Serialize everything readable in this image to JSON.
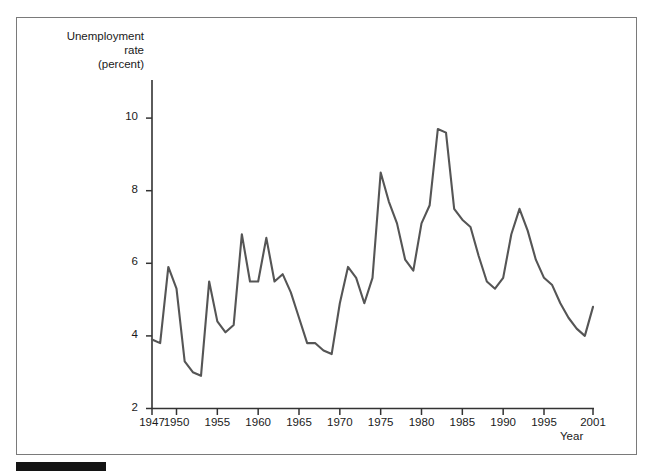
{
  "figure": {
    "y_axis_title": "Unemployment\nrate\n(percent)",
    "x_axis_title": "Year",
    "line_color": "#555555",
    "axis_color": "#333333",
    "frame_color": "#7a7a7a",
    "footer_bar_color": "#141414"
  },
  "chart_data": {
    "type": "line",
    "title": "",
    "subtitle": "",
    "xlabel": "Year",
    "ylabel": "Unemployment rate (percent)",
    "xlim": [
      1947,
      2001
    ],
    "ylim": [
      2,
      10.6
    ],
    "grid": false,
    "legend": "none",
    "y_ticks": [
      2,
      4,
      6,
      8,
      10
    ],
    "y_tick_labels": [
      "2",
      "4",
      "6",
      "8",
      "10"
    ],
    "x_ticks": [
      1947,
      1950,
      1955,
      1960,
      1965,
      1970,
      1975,
      1980,
      1985,
      1990,
      1995,
      2001
    ],
    "x_tick_labels": [
      "1947",
      "1950",
      "1955",
      "1960",
      "1965",
      "1970",
      "1975",
      "1980",
      "1985",
      "1990",
      "1995",
      "2001"
    ],
    "series": [
      {
        "name": "Unemployment rate",
        "x": [
          1947,
          1948,
          1949,
          1950,
          1951,
          1952,
          1953,
          1954,
          1955,
          1956,
          1957,
          1958,
          1959,
          1960,
          1961,
          1962,
          1963,
          1964,
          1965,
          1966,
          1967,
          1968,
          1969,
          1970,
          1971,
          1972,
          1973,
          1974,
          1975,
          1976,
          1977,
          1978,
          1979,
          1980,
          1981,
          1982,
          1983,
          1984,
          1985,
          1986,
          1987,
          1988,
          1989,
          1990,
          1991,
          1992,
          1993,
          1994,
          1995,
          1996,
          1997,
          1998,
          1999,
          2000,
          2001
        ],
        "values": [
          3.9,
          3.8,
          5.9,
          5.3,
          3.3,
          3.0,
          2.9,
          5.5,
          4.4,
          4.1,
          4.3,
          6.8,
          5.5,
          5.5,
          6.7,
          5.5,
          5.7,
          5.2,
          4.5,
          3.8,
          3.8,
          3.6,
          3.5,
          4.9,
          5.9,
          5.6,
          4.9,
          5.6,
          8.5,
          7.7,
          7.1,
          6.1,
          5.8,
          7.1,
          7.6,
          9.7,
          9.6,
          7.5,
          7.2,
          7.0,
          6.2,
          5.5,
          5.3,
          5.6,
          6.8,
          7.5,
          6.9,
          6.1,
          5.6,
          5.4,
          4.9,
          4.5,
          4.2,
          4.0,
          4.8
        ]
      }
    ]
  }
}
